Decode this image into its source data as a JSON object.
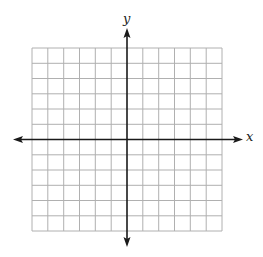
{
  "diagram": {
    "type": "coordinate-plane",
    "x_axis_label": "x",
    "y_axis_label": "y",
    "grid": {
      "columns": 12,
      "rows": 12,
      "columns_left_of_origin": 6,
      "columns_right_of_origin": 6,
      "rows_above_origin": 6,
      "rows_below_origin": 6,
      "line_color": "#b0b0b0",
      "axis_color": "#1a1a1a"
    },
    "axes": {
      "x_arrows": "both",
      "y_arrows": "both"
    }
  }
}
